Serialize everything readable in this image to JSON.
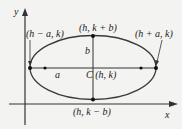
{
  "diagram": {
    "type": "ellipse-with-axes",
    "colors": {
      "background": "#f3f3f1",
      "curve": "#3a3a3a",
      "axes": "#333333",
      "text": "#222222"
    },
    "axes": {
      "x_label": "x",
      "y_label": "y"
    },
    "labels": {
      "left_vertex": "(h − a, k)",
      "right_vertex": "(h + a, k)",
      "top_vertex": "(h, k + b)",
      "bottom_vertex": "(h, k − b)",
      "center": "C (h, k)",
      "semi_major": "a",
      "semi_minor": "b"
    },
    "points": [
      "left-vertex",
      "left-focus",
      "top-vertex",
      "bottom-vertex",
      "right-focus",
      "right-vertex"
    ]
  }
}
